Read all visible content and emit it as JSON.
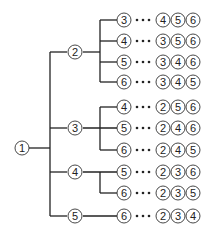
{
  "diagram": {
    "type": "tree",
    "root": "1",
    "branches": [
      {
        "node": "2",
        "leaves": [
          {
            "node": "3",
            "rest": [
              "4",
              "5",
              "6"
            ]
          },
          {
            "node": "4",
            "rest": [
              "3",
              "5",
              "6"
            ]
          },
          {
            "node": "5",
            "rest": [
              "3",
              "4",
              "6"
            ]
          },
          {
            "node": "6",
            "rest": [
              "3",
              "4",
              "5"
            ]
          }
        ]
      },
      {
        "node": "3",
        "leaves": [
          {
            "node": "4",
            "rest": [
              "2",
              "5",
              "6"
            ]
          },
          {
            "node": "5",
            "rest": [
              "2",
              "4",
              "6"
            ]
          },
          {
            "node": "6",
            "rest": [
              "2",
              "4",
              "5"
            ]
          }
        ]
      },
      {
        "node": "4",
        "leaves": [
          {
            "node": "5",
            "rest": [
              "2",
              "3",
              "6"
            ]
          },
          {
            "node": "6",
            "rest": [
              "2",
              "3",
              "5"
            ]
          }
        ]
      },
      {
        "node": "5",
        "leaves": [
          {
            "node": "6",
            "rest": [
              "2",
              "3",
              "4"
            ]
          }
        ]
      }
    ]
  }
}
